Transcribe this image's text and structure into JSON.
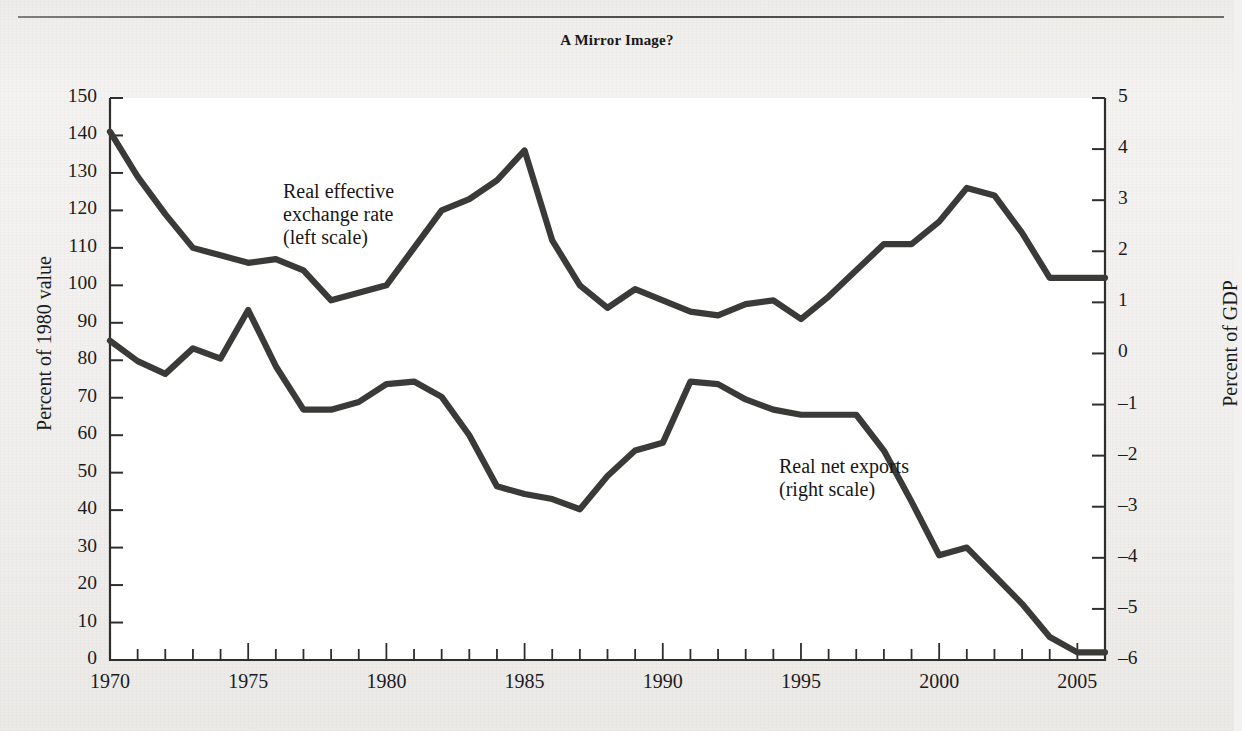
{
  "figure": {
    "title": "A Mirror Image?",
    "background_color": "#f1f0ee",
    "plot_background_color": "#ffffff",
    "line_color": "#3a3a38"
  },
  "axes": {
    "left": {
      "label": "Percent of 1980 value",
      "ticks": [
        "150",
        "140",
        "130",
        "120",
        "110",
        "100",
        "90",
        "80",
        "70",
        "60",
        "50",
        "40",
        "30",
        "20",
        "10",
        "0"
      ],
      "min": 0,
      "max": 150
    },
    "right": {
      "label": "Percent of GDP",
      "ticks": [
        "5",
        "4",
        "3",
        "2",
        "1",
        "0",
        "–1",
        "–2",
        "–3",
        "–4",
        "–5",
        "–6"
      ],
      "min": -6,
      "max": 5
    },
    "bottom": {
      "ticks": [
        "1970",
        "1975",
        "1980",
        "1985",
        "1990",
        "1995",
        "2000",
        "2005"
      ],
      "min": 1970,
      "max": 2006
    }
  },
  "series_labels": {
    "exchange_rate": "Real effective\nexchange rate\n(left scale)",
    "net_exports": "Real net exports\n(right scale)"
  },
  "chart_data": {
    "type": "line",
    "title": "A Mirror Image?",
    "xlabel": "",
    "ylabel": "Percent of 1980 value",
    "y2label": "Percent of GDP",
    "xlim": [
      1970,
      2006
    ],
    "ylim": [
      0,
      150
    ],
    "y2lim": [
      -6,
      5
    ],
    "grid": false,
    "legend": "inline-annotations",
    "x": [
      1970,
      1971,
      1972,
      1973,
      1974,
      1975,
      1976,
      1977,
      1978,
      1979,
      1980,
      1981,
      1982,
      1983,
      1984,
      1985,
      1986,
      1987,
      1988,
      1989,
      1990,
      1991,
      1992,
      1993,
      1994,
      1995,
      1996,
      1997,
      1998,
      1999,
      2000,
      2001,
      2002,
      2003,
      2004,
      2005,
      2006
    ],
    "series": [
      {
        "name": "Real effective exchange rate (left scale)",
        "axis": "left",
        "units": "Percent of 1980 value",
        "values": [
          141,
          129,
          119,
          110,
          108,
          106,
          107,
          104,
          96,
          98,
          100,
          110,
          120,
          123,
          128,
          136,
          112,
          100,
          94,
          99,
          96,
          93,
          92,
          95,
          96,
          91,
          97,
          104,
          111,
          111,
          117,
          126,
          124,
          114,
          102,
          102,
          102
        ]
      },
      {
        "name": "Real net exports (right scale)",
        "axis": "right",
        "units": "Percent of GDP",
        "values": [
          0.25,
          -0.15,
          -0.4,
          0.1,
          -0.1,
          0.85,
          -0.25,
          -1.1,
          -1.1,
          -0.95,
          -0.6,
          -0.55,
          -0.85,
          -1.6,
          -2.6,
          -2.75,
          -2.85,
          -3.05,
          -2.4,
          -1.9,
          -1.75,
          -0.55,
          -0.6,
          -0.9,
          -1.1,
          -1.2,
          -1.2,
          -1.2,
          -1.9,
          -2.9,
          -3.95,
          -3.8,
          -4.35,
          -4.9,
          -5.55,
          -5.85,
          -5.85
        ]
      }
    ]
  }
}
